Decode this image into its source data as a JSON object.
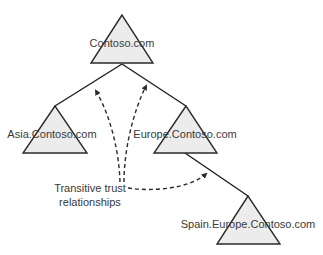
{
  "diagram": {
    "type": "domain-tree",
    "domains": {
      "root": "Contoso.com",
      "asia": "Asia.Contoso.com",
      "europe": "Europe.Contoso.com",
      "spain": "Spain.Europe.Contoso.com"
    },
    "hierarchy": [
      {
        "parent": "Contoso.com",
        "child": "Asia.Contoso.com"
      },
      {
        "parent": "Contoso.com",
        "child": "Europe.Contoso.com"
      },
      {
        "parent": "Europe.Contoso.com",
        "child": "Spain.Europe.Contoso.com"
      }
    ],
    "trust_caption": {
      "line1": "Transitive trust",
      "line2": "relationships"
    },
    "trust_arrows": [
      {
        "from": "caption",
        "to": "Asia-Contoso link"
      },
      {
        "from": "caption",
        "to": "Europe-Contoso link"
      },
      {
        "from": "caption",
        "to": "Europe-Spain link"
      }
    ]
  }
}
